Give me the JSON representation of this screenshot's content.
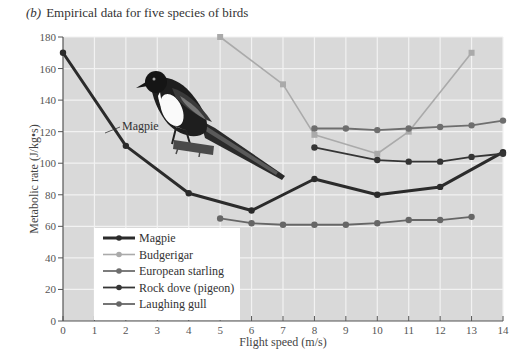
{
  "chart_data": {
    "type": "line",
    "title": "Empirical data for five species of birds",
    "panel_label": "(b)",
    "xlabel": "Flight speed (m/s)",
    "ylabel": "Metabolic rate (J/kg•s)",
    "xlim": [
      0,
      14
    ],
    "ylim": [
      0,
      180
    ],
    "x_ticks": [
      0,
      1,
      2,
      3,
      4,
      5,
      6,
      7,
      8,
      9,
      10,
      11,
      12,
      13,
      14
    ],
    "y_ticks": [
      0,
      20,
      40,
      60,
      80,
      100,
      120,
      140,
      160,
      180
    ],
    "grid": true,
    "legend_position": "lower-left",
    "annotations": [
      {
        "text": "Magpie",
        "x": 2.4,
        "y": 119,
        "points_to_series": "Magpie"
      }
    ],
    "series": [
      {
        "name": "Magpie",
        "color": "#2b2b2b",
        "width": 3,
        "x": [
          0,
          2,
          4,
          6,
          8,
          10,
          12,
          14
        ],
        "values": [
          170,
          111,
          81,
          70,
          90,
          80,
          85,
          107
        ]
      },
      {
        "name": "Budgerigar",
        "color": "#aaaaaa",
        "width": 1.6,
        "x": [
          5,
          7,
          8,
          10,
          11,
          13
        ],
        "values": [
          180,
          150,
          118,
          106,
          120,
          170
        ]
      },
      {
        "name": "European starling",
        "color": "#6e6e6e",
        "width": 1.8,
        "x": [
          8,
          9,
          10,
          11,
          12,
          13,
          14
        ],
        "values": [
          122,
          122,
          121,
          122,
          123,
          124,
          127
        ]
      },
      {
        "name": "Rock dove (pigeon)",
        "color": "#353535",
        "width": 1.8,
        "x": [
          8,
          10,
          11,
          12,
          13,
          14
        ],
        "values": [
          110,
          102,
          101,
          101,
          104,
          106
        ]
      },
      {
        "name": "Laughing gull",
        "color": "#666666",
        "width": 1.8,
        "x": [
          5,
          6,
          7,
          8,
          9,
          10,
          11,
          12,
          13
        ],
        "values": [
          65,
          62,
          61,
          61,
          61,
          62,
          64,
          64,
          66
        ]
      }
    ]
  },
  "colors": {
    "plot_background": "#d9d9d9",
    "gridline": "#f2f2f2",
    "axis": "#555555",
    "legend_background": "#ffffff"
  },
  "illustration": {
    "subject": "magpie bird perched on a branch"
  }
}
